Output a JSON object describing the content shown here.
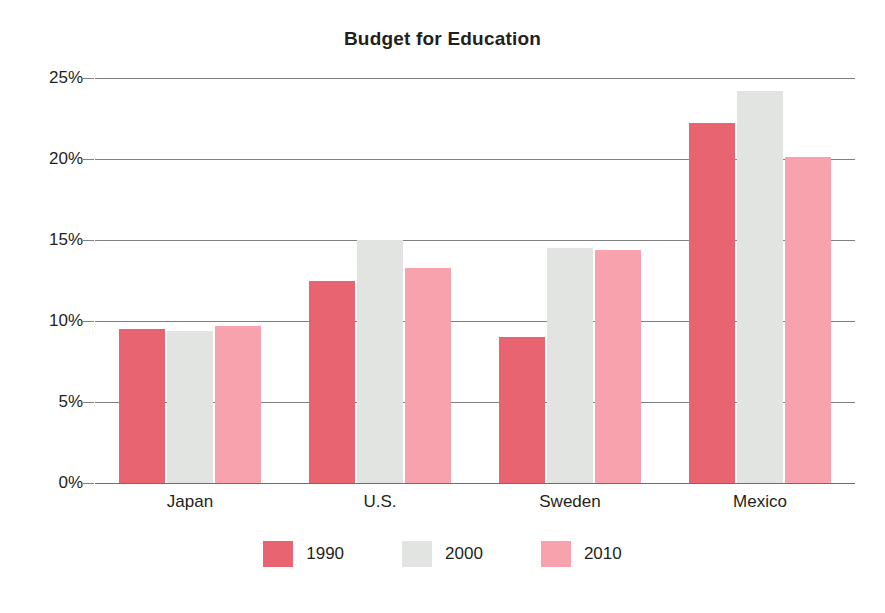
{
  "chart_data": {
    "type": "bar",
    "title": "Budget for Education",
    "subtitle": "",
    "xlabel": "",
    "ylabel": "",
    "categories": [
      "Japan",
      "U.S.",
      "Sweden",
      "Mexico"
    ],
    "series": [
      {
        "name": "1990",
        "color": "#E86470",
        "values": [
          9.5,
          12.5,
          9.0,
          22.2
        ]
      },
      {
        "name": "2000",
        "color": "#E2E4E1",
        "values": [
          9.4,
          15.0,
          14.5,
          24.2
        ]
      },
      {
        "name": "2010",
        "color": "#F7A2AD",
        "values": [
          9.7,
          13.3,
          14.4,
          20.1
        ]
      }
    ],
    "ylim": [
      0,
      25
    ],
    "y_ticks": [
      0,
      5,
      10,
      15,
      20,
      25
    ],
    "y_tick_labels": [
      "0%",
      "5%",
      "10%",
      "15%",
      "20%",
      "25%"
    ],
    "grid": true,
    "legend_position": "bottom",
    "value_suffix": "%"
  },
  "colors": {
    "background": "#FFFFFF",
    "text": "#231F20",
    "gridline": "#808080",
    "series_1990": "#E86470",
    "series_2000": "#E2E4E1",
    "series_2010": "#F7A2AD"
  }
}
